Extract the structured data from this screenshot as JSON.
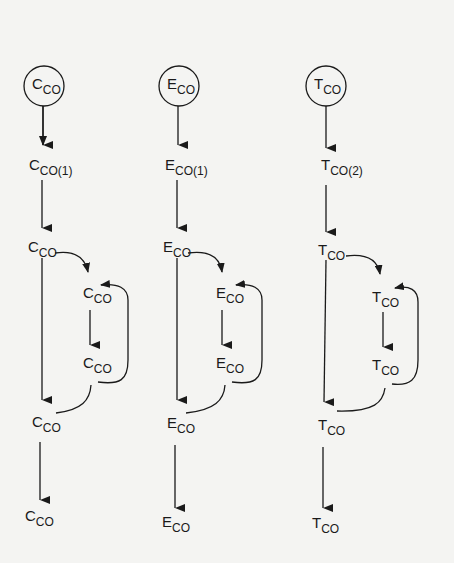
{
  "diagram": {
    "type": "flow-diagram",
    "columns": [
      {
        "id": "C",
        "start_node": {
          "base": "C",
          "sub": "CO"
        },
        "nodes": [
          {
            "base": "C",
            "sub": "CO(1)"
          },
          {
            "base": "C",
            "sub": "CO"
          },
          {
            "base": "C",
            "sub": "CO"
          },
          {
            "base": "C",
            "sub": "CO"
          },
          {
            "base": "C",
            "sub": "CO"
          },
          {
            "base": "C",
            "sub": "CO"
          }
        ]
      },
      {
        "id": "E",
        "start_node": {
          "base": "E",
          "sub": "CO"
        },
        "nodes": [
          {
            "base": "E",
            "sub": "CO(1)"
          },
          {
            "base": "E",
            "sub": "CO"
          },
          {
            "base": "E",
            "sub": "CO"
          },
          {
            "base": "E",
            "sub": "CO"
          },
          {
            "base": "E",
            "sub": "CO"
          },
          {
            "base": "E",
            "sub": "CO"
          }
        ]
      },
      {
        "id": "T",
        "start_node": {
          "base": "T",
          "sub": "CO"
        },
        "nodes": [
          {
            "base": "T",
            "sub": "CO(2)"
          },
          {
            "base": "T",
            "sub": "CO"
          },
          {
            "base": "T",
            "sub": "CO"
          },
          {
            "base": "T",
            "sub": "CO"
          },
          {
            "base": "T",
            "sub": "CO"
          },
          {
            "base": "T",
            "sub": "CO"
          }
        ]
      }
    ]
  }
}
